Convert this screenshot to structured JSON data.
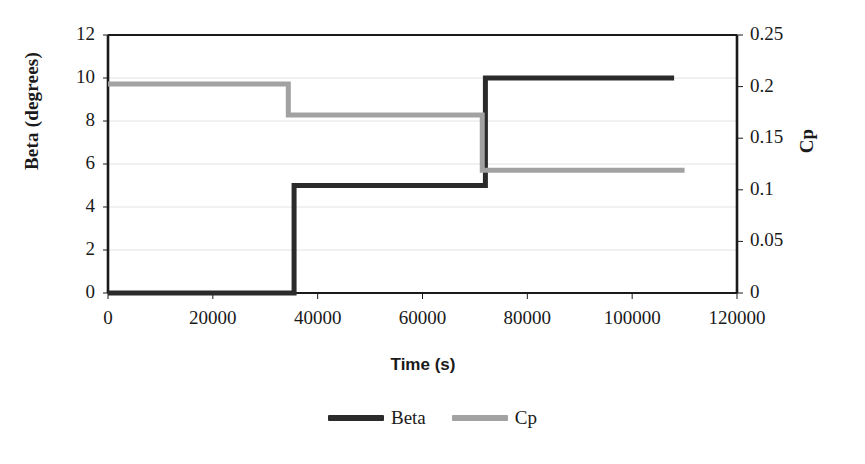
{
  "chart_data": {
    "type": "line",
    "title": "",
    "xlabel": "Time (s)",
    "ylabel": "Beta (degrees)",
    "y2label": "Cp",
    "xlim": [
      0,
      120000
    ],
    "ylim": [
      0,
      12
    ],
    "y2lim": [
      0,
      0.25
    ],
    "grid": true,
    "legend_position": "bottom-center",
    "xticks": [
      0,
      20000,
      40000,
      60000,
      80000,
      100000,
      120000
    ],
    "xtick_labels": [
      "0",
      "20000",
      "40000",
      "60000",
      "80000",
      "100000",
      "120000"
    ],
    "yticks": [
      0,
      2,
      4,
      6,
      8,
      10,
      12
    ],
    "ytick_labels": [
      "0",
      "2",
      "4",
      "6",
      "8",
      "10",
      "12"
    ],
    "y2ticks": [
      0,
      0.05,
      0.1,
      0.15,
      0.2,
      0.25
    ],
    "y2tick_labels": [
      "0",
      "0.05",
      "0.1",
      "0.15",
      "0.2",
      "0.25"
    ],
    "series": [
      {
        "name": "Beta",
        "axis": "left",
        "color": "#2b2b2b",
        "line_width": 5,
        "style": "step",
        "x": [
          0,
          35500,
          35500,
          72000,
          72000,
          108000
        ],
        "y": [
          0,
          0,
          5,
          5,
          10,
          10
        ]
      },
      {
        "name": "Cp",
        "axis": "right",
        "color": "#a2a2a2",
        "line_width": 5,
        "style": "step",
        "x": [
          0,
          34400,
          34400,
          71400,
          71400,
          110000
        ],
        "y": [
          0.2025,
          0.2025,
          0.1725,
          0.1725,
          0.119,
          0.119
        ]
      }
    ]
  },
  "legend": {
    "entries": [
      {
        "label": "Beta",
        "color": "#2b2b2b"
      },
      {
        "label": "Cp",
        "color": "#a2a2a2"
      }
    ]
  },
  "colors": {
    "beta": "#2b2b2b",
    "cp": "#a2a2a2",
    "axis": "#1a1a1a",
    "grid": "#e2e2e2",
    "background": "#ffffff"
  }
}
